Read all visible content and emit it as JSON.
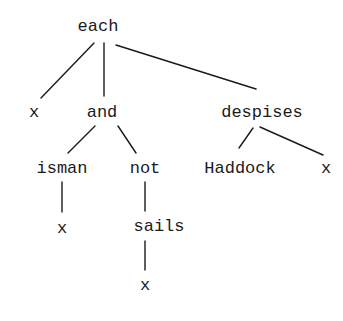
{
  "diagram": {
    "type": "tree",
    "nodes": [
      {
        "id": "each",
        "label": "each",
        "x": 98,
        "y": 26
      },
      {
        "id": "x1",
        "label": "x",
        "x": 34,
        "y": 112
      },
      {
        "id": "and",
        "label": "and",
        "x": 102,
        "y": 112
      },
      {
        "id": "despises",
        "label": "despises",
        "x": 262,
        "y": 112
      },
      {
        "id": "isman",
        "label": "isman",
        "x": 62,
        "y": 168
      },
      {
        "id": "not",
        "label": "not",
        "x": 145,
        "y": 168
      },
      {
        "id": "Haddock",
        "label": "Haddock",
        "x": 240,
        "y": 168
      },
      {
        "id": "x2",
        "label": "x",
        "x": 326,
        "y": 168
      },
      {
        "id": "x3",
        "label": "x",
        "x": 62,
        "y": 228
      },
      {
        "id": "sails",
        "label": "sails",
        "x": 159,
        "y": 226
      },
      {
        "id": "x4",
        "label": "x",
        "x": 145,
        "y": 285
      }
    ],
    "edges": [
      {
        "from": "each",
        "to": "x1",
        "x1": 94,
        "y1": 43,
        "x2": 41,
        "y2": 98
      },
      {
        "from": "each",
        "to": "and",
        "x1": 104,
        "y1": 43,
        "x2": 104,
        "y2": 96
      },
      {
        "from": "each",
        "to": "despises",
        "x1": 116,
        "y1": 45,
        "x2": 256,
        "y2": 89
      },
      {
        "from": "and",
        "to": "isman",
        "x1": 95,
        "y1": 126,
        "x2": 68,
        "y2": 153
      },
      {
        "from": "and",
        "to": "not",
        "x1": 118,
        "y1": 126,
        "x2": 136,
        "y2": 153
      },
      {
        "from": "despises",
        "to": "Haddock",
        "x1": 253,
        "y1": 128,
        "x2": 239,
        "y2": 148
      },
      {
        "from": "despises",
        "to": "x2",
        "x1": 260,
        "y1": 127,
        "x2": 323,
        "y2": 155
      },
      {
        "from": "isman",
        "to": "x3",
        "x1": 62,
        "y1": 182,
        "x2": 62,
        "y2": 212
      },
      {
        "from": "not",
        "to": "sails",
        "x1": 145,
        "y1": 182,
        "x2": 145,
        "y2": 211
      },
      {
        "from": "sails",
        "to": "x4",
        "x1": 145,
        "y1": 241,
        "x2": 145,
        "y2": 270
      }
    ]
  }
}
